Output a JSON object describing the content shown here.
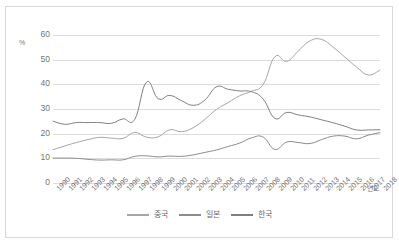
{
  "chart_data": {
    "type": "line",
    "title": "",
    "xlabel": "연도",
    "ylabel": "%",
    "ylim": [
      0,
      60
    ],
    "yticks": [
      0,
      10,
      20,
      30,
      40,
      50,
      60
    ],
    "grid": true,
    "legend_position": "bottom",
    "categories": [
      "1990",
      "1991",
      "1992",
      "1993",
      "1994",
      "1995",
      "1996",
      "1997",
      "1998",
      "1999",
      "2000",
      "2001",
      "2002",
      "2003",
      "2004",
      "2005",
      "2006",
      "2007",
      "2008",
      "2009",
      "2010",
      "2011",
      "2012",
      "2013",
      "2014",
      "2015",
      "2016",
      "2017",
      "2018"
    ],
    "series": [
      {
        "name": "중국",
        "color": "#a6a6a6",
        "values": [
          13.5,
          15.0,
          16.4,
          17.6,
          18.5,
          18.2,
          18.1,
          20.5,
          18.6,
          18.7,
          21.6,
          20.8,
          22.4,
          25.8,
          29.8,
          32.6,
          35.4,
          37.2,
          40.0,
          51.2,
          49.3,
          53.5,
          57.6,
          58.2,
          55.0,
          51.0,
          47.0,
          43.8,
          45.8
        ]
      },
      {
        "name": "일본",
        "color": "#8c8c8c",
        "values": [
          10.1,
          10.1,
          10.0,
          9.6,
          9.3,
          9.4,
          9.4,
          10.8,
          11.0,
          10.6,
          10.9,
          10.8,
          11.4,
          12.4,
          13.4,
          14.8,
          16.2,
          18.3,
          18.6,
          13.6,
          16.6,
          16.4,
          16.0,
          17.6,
          19.0,
          19.0,
          17.9,
          19.4,
          20.4
        ]
      },
      {
        "name": "한국",
        "color": "#7f7f7f",
        "values": [
          25.1,
          23.8,
          24.5,
          24.5,
          24.5,
          24.2,
          26.0,
          25.8,
          40.9,
          34.2,
          35.5,
          33.4,
          31.5,
          33.6,
          39.0,
          38.0,
          37.3,
          37.0,
          34.0,
          26.2,
          28.6,
          27.6,
          26.8,
          25.6,
          24.4,
          23.0,
          21.5,
          21.5,
          21.6
        ]
      }
    ]
  },
  "axis": {
    "percent_symbol": "%",
    "year_label": "연도"
  },
  "legend": {
    "entries": [
      {
        "label": "중국"
      },
      {
        "label": "일본"
      },
      {
        "label": "한국"
      }
    ]
  }
}
